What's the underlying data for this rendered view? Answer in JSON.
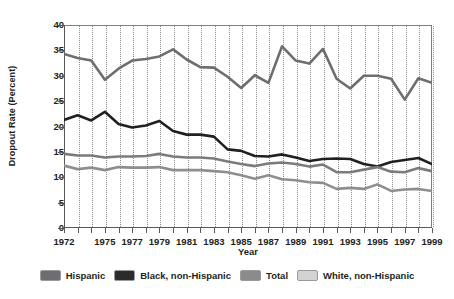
{
  "chart_data": {
    "type": "line",
    "title": "",
    "xlabel": "Year",
    "ylabel": "Dropout Rate (Percent)",
    "xlim": [
      1972,
      1999
    ],
    "ylim": [
      0,
      40
    ],
    "ytick_step": 5,
    "grid": "vertical-dotted-every-year",
    "legend_position": "bottom",
    "x": [
      1972,
      1973,
      1974,
      1975,
      1976,
      1977,
      1978,
      1979,
      1980,
      1981,
      1982,
      1983,
      1984,
      1985,
      1986,
      1987,
      1988,
      1989,
      1990,
      1991,
      1992,
      1993,
      1994,
      1995,
      1996,
      1997,
      1998,
      1999
    ],
    "xtick_labels": [
      "1972",
      "",
      "",
      "1975",
      "",
      "1977",
      "",
      "1979",
      "",
      "1981",
      "",
      "1983",
      "",
      "1985",
      "",
      "1987",
      "",
      "1989",
      "",
      "1991",
      "",
      "1993",
      "",
      "1995",
      "",
      "1997",
      "",
      "1999"
    ],
    "ytick_labels": [
      "0",
      "5",
      "10",
      "15",
      "20",
      "25",
      "30",
      "35",
      "40"
    ],
    "series": [
      {
        "name": "Hispanic",
        "color": "#6d6e71",
        "values": [
          34.3,
          33.5,
          33.0,
          29.2,
          31.4,
          33.0,
          33.3,
          33.8,
          35.2,
          33.2,
          31.7,
          31.6,
          29.8,
          27.6,
          30.1,
          28.6,
          35.8,
          33.0,
          32.4,
          35.3,
          29.4,
          27.5,
          30.0,
          30.0,
          29.4,
          25.3,
          29.5,
          28.6
        ]
      },
      {
        "name": "Black, non-Hispanic",
        "color": "#231f20",
        "values": [
          21.3,
          22.2,
          21.2,
          22.9,
          20.5,
          19.8,
          20.2,
          21.1,
          19.1,
          18.4,
          18.4,
          18.0,
          15.5,
          15.2,
          14.2,
          14.1,
          14.5,
          13.9,
          13.2,
          13.6,
          13.7,
          13.6,
          12.6,
          12.1,
          13.0,
          13.4,
          13.8,
          12.6
        ]
      },
      {
        "name": "Total",
        "color": "#7a7b7e",
        "values": [
          14.6,
          14.3,
          14.3,
          13.9,
          14.1,
          14.1,
          14.2,
          14.6,
          14.1,
          13.9,
          13.9,
          13.7,
          13.1,
          12.6,
          12.2,
          12.7,
          12.9,
          12.6,
          12.1,
          12.5,
          11.0,
          11.0,
          11.5,
          12.0,
          11.1,
          11.0,
          11.8,
          11.2
        ]
      },
      {
        "name": "White, non-Hispanic",
        "color": "#8d8e90",
        "values": [
          12.3,
          11.6,
          11.9,
          11.4,
          12.0,
          11.9,
          11.9,
          12.0,
          11.4,
          11.4,
          11.4,
          11.2,
          11.0,
          10.4,
          9.7,
          10.4,
          9.6,
          9.4,
          9.0,
          8.9,
          7.7,
          7.9,
          7.7,
          8.6,
          7.3,
          7.6,
          7.7,
          7.3
        ]
      }
    ]
  },
  "legend": {
    "items": [
      {
        "label": "Hispanic",
        "color": "#6d6e71"
      },
      {
        "label": "Black, non-Hispanic",
        "color": "#2b2b2d"
      },
      {
        "label": "Total",
        "color": "#8a8b8d"
      },
      {
        "label": "White, non-Hispanic",
        "color": "#d2d3d4"
      }
    ]
  }
}
